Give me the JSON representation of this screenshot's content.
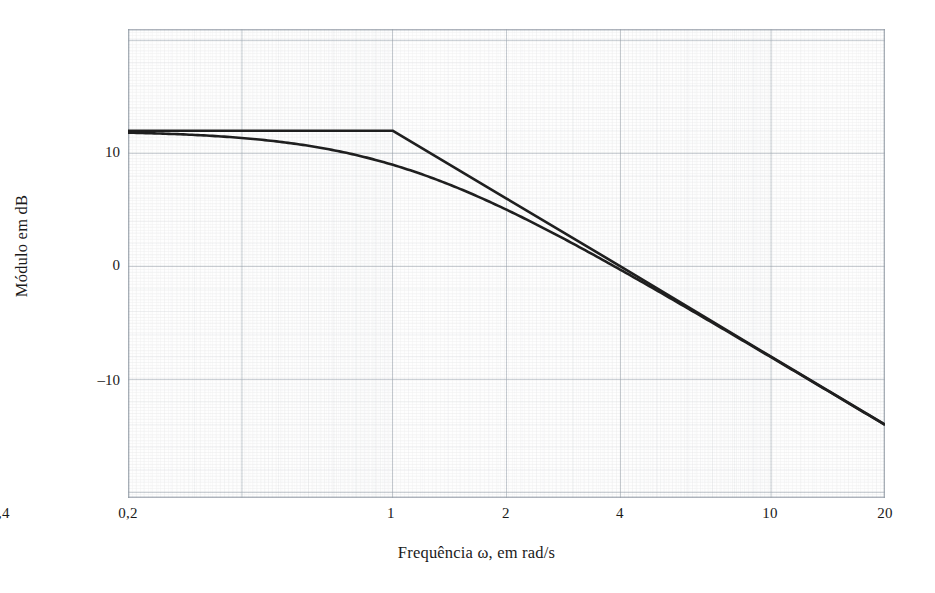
{
  "figure": {
    "kind": "semilog-graph-paper",
    "background_color": "#ffffff",
    "grid_color": "#9aa3ae",
    "grid_minor_color": "#c7ccd3",
    "curve_color": "#1f1f1f"
  },
  "axes": {
    "x_label": "Frequência ω, em rad/s",
    "y_label": "Módulo em dB",
    "x_ticks": [
      {
        "label": "0,2",
        "value": 0.2
      },
      {
        "label": "0,4",
        "value": 0.4
      },
      {
        "label": "1",
        "value": 1
      },
      {
        "label": "2",
        "value": 2
      },
      {
        "label": "4",
        "value": 4
      },
      {
        "label": "10",
        "value": 10
      },
      {
        "label": "20",
        "value": 20
      }
    ],
    "y_ticks": [
      {
        "label": "10",
        "value": 10
      },
      {
        "label": "0",
        "value": 0
      },
      {
        "label": "–10",
        "value": -10
      }
    ]
  },
  "chart_data": {
    "type": "line",
    "title": "",
    "xlabel": "Frequência ω, em rad/s",
    "ylabel": "Módulo em dB",
    "xscale": "log",
    "xlim": [
      0.2,
      20
    ],
    "ylim": [
      -20.5,
      21.0
    ],
    "grid": true,
    "legend": "none",
    "annotations": [
      "Asymptote breakpoint at ω = 1 rad/s, 12 dB",
      "High-frequency slope ≈ –20 dB/decade",
      "Actual curve is 3 dB below asymptote at the corner frequency"
    ],
    "series": [
      {
        "name": "Assíntotas (aproximação de Bode)",
        "x": [
          0.2,
          1,
          2,
          4,
          10,
          20
        ],
        "values": [
          12,
          12,
          6,
          0,
          -8,
          -14
        ]
      },
      {
        "name": "Curva real (módulo exato)",
        "x": [
          0.2,
          0.3,
          0.4,
          0.5,
          0.7,
          1,
          1.4,
          2,
          3,
          4,
          6,
          10,
          14,
          20
        ],
        "values": [
          11.6,
          11.2,
          10.7,
          10.0,
          8.7,
          9.0,
          6.2,
          3.0,
          -0.5,
          -3.0,
          -6.6,
          -11.0,
          -13.9,
          -17.0
        ]
      }
    ]
  }
}
